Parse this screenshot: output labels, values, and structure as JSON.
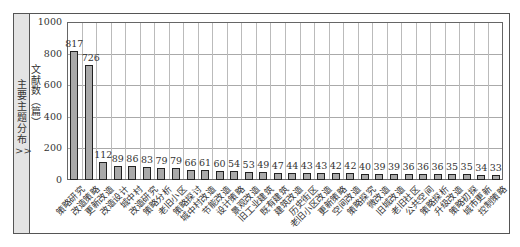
{
  "side_panel": {
    "title": "主要主题分布",
    "arrow": ">>"
  },
  "chart_data": {
    "type": "bar",
    "title": "",
    "xlabel": "",
    "ylabel": "文献数(篇)",
    "ylim": [
      0,
      1000
    ],
    "yticks": [
      0,
      200,
      400,
      600,
      800,
      1000
    ],
    "grid": true,
    "legend": null,
    "categories": [
      "策略研究",
      "改造策略",
      "更新改造",
      "改造设计",
      "城中村",
      "改造研究",
      "策略分析",
      "老旧小区",
      "策略探讨",
      "城中村改造",
      "节能改造",
      "设计策略",
      "景观改造",
      "旧工业建筑",
      "既有建筑",
      "建筑改造",
      "历史街区",
      "老旧小区改造",
      "更新策略",
      "空间改造",
      "策略探究",
      "微改造",
      "旧城改造",
      "老旧社区",
      "公共空间",
      "策略探析",
      "升级改造",
      "策略初探",
      "城市更新",
      "控制策略"
    ],
    "values": [
      817,
      726,
      112,
      89,
      86,
      83,
      79,
      79,
      66,
      61,
      60,
      54,
      53,
      49,
      47,
      44,
      43,
      43,
      42,
      42,
      40,
      39,
      39,
      36,
      36,
      36,
      35,
      35,
      34,
      33
    ],
    "colors": {
      "bar": "#a9a9a9",
      "bar_border": "#222222",
      "grid": "#aaaaaa"
    }
  }
}
